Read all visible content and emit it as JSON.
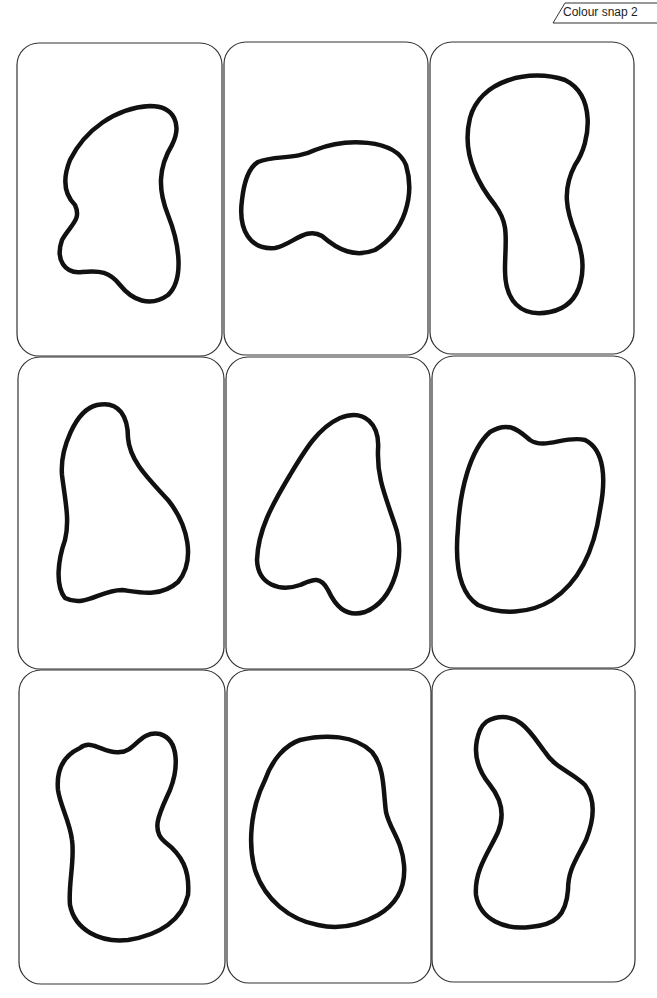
{
  "header": {
    "tag_label": "Colour snap 2"
  },
  "colors": {
    "card_border": "#333333",
    "blob_stroke": "#111111",
    "background": "#ffffff"
  },
  "grid": {
    "rows": 3,
    "columns": 3
  },
  "cards": [
    {
      "row": 1,
      "col": 1,
      "shape": "blob-shape-1"
    },
    {
      "row": 1,
      "col": 2,
      "shape": "blob-shape-2"
    },
    {
      "row": 1,
      "col": 3,
      "shape": "blob-shape-3"
    },
    {
      "row": 2,
      "col": 1,
      "shape": "blob-shape-4"
    },
    {
      "row": 2,
      "col": 2,
      "shape": "blob-shape-5"
    },
    {
      "row": 2,
      "col": 3,
      "shape": "blob-shape-6"
    },
    {
      "row": 3,
      "col": 1,
      "shape": "blob-shape-7"
    },
    {
      "row": 3,
      "col": 2,
      "shape": "blob-shape-8"
    },
    {
      "row": 3,
      "col": 3,
      "shape": "blob-shape-9"
    }
  ]
}
